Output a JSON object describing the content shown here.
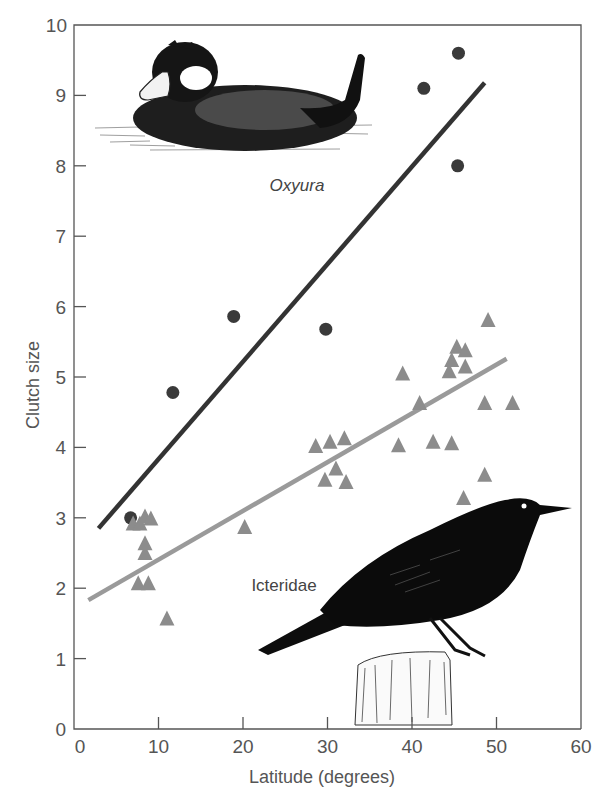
{
  "chart_data": {
    "type": "scatter",
    "title": "",
    "xlabel": "Latitude (degrees)",
    "ylabel": "Clutch size",
    "xlim": [
      0,
      60
    ],
    "ylim": [
      0,
      10
    ],
    "x_ticks": [
      0,
      10,
      20,
      30,
      40,
      50,
      60
    ],
    "y_ticks": [
      0,
      1,
      2,
      3,
      4,
      5,
      6,
      7,
      8,
      9,
      10
    ],
    "grid": false,
    "legend": "none (series labeled directly with text and illustrations)",
    "series": [
      {
        "name": "Oxyura",
        "marker": "circle",
        "color": "#3a3a3a",
        "points": [
          {
            "x": 6.7,
            "y": 3.0
          },
          {
            "x": 11.7,
            "y": 4.78
          },
          {
            "x": 18.9,
            "y": 5.86
          },
          {
            "x": 29.8,
            "y": 5.68
          },
          {
            "x": 41.4,
            "y": 9.1
          },
          {
            "x": 45.5,
            "y": 9.6
          },
          {
            "x": 45.4,
            "y": 8.0
          }
        ],
        "trendline": {
          "x": [
            2.9,
            48.6
          ],
          "y": [
            2.85,
            9.18
          ],
          "color": "#333333"
        }
      },
      {
        "name": "Icteridae",
        "marker": "triangle",
        "color": "#8c8c8c",
        "points": [
          {
            "x": 7.0,
            "y": 2.92
          },
          {
            "x": 7.8,
            "y": 2.92
          },
          {
            "x": 8.4,
            "y": 3.02
          },
          {
            "x": 9.1,
            "y": 2.99
          },
          {
            "x": 8.4,
            "y": 2.64
          },
          {
            "x": 8.4,
            "y": 2.5
          },
          {
            "x": 7.6,
            "y": 2.07
          },
          {
            "x": 8.8,
            "y": 2.07
          },
          {
            "x": 11.0,
            "y": 1.57
          },
          {
            "x": 20.2,
            "y": 2.87
          },
          {
            "x": 28.6,
            "y": 4.02
          },
          {
            "x": 30.3,
            "y": 4.08
          },
          {
            "x": 32.0,
            "y": 4.13
          },
          {
            "x": 31.0,
            "y": 3.7
          },
          {
            "x": 29.7,
            "y": 3.54
          },
          {
            "x": 32.2,
            "y": 3.51
          },
          {
            "x": 38.4,
            "y": 4.03
          },
          {
            "x": 38.9,
            "y": 5.05
          },
          {
            "x": 40.9,
            "y": 4.63
          },
          {
            "x": 42.5,
            "y": 4.08
          },
          {
            "x": 44.7,
            "y": 4.06
          },
          {
            "x": 44.4,
            "y": 5.08
          },
          {
            "x": 44.7,
            "y": 5.24
          },
          {
            "x": 45.3,
            "y": 5.43
          },
          {
            "x": 46.3,
            "y": 5.38
          },
          {
            "x": 46.3,
            "y": 5.15
          },
          {
            "x": 46.1,
            "y": 3.28
          },
          {
            "x": 48.6,
            "y": 3.61
          },
          {
            "x": 48.6,
            "y": 4.63
          },
          {
            "x": 49.0,
            "y": 5.81
          },
          {
            "x": 51.9,
            "y": 4.63
          }
        ],
        "trendline": {
          "x": [
            1.7,
            51.2
          ],
          "y": [
            1.83,
            5.26
          ],
          "color": "#9a9a9a"
        }
      }
    ],
    "annotations": [
      {
        "text": "Oxyura",
        "x": 30.5,
        "y": 7.75,
        "style": "italic",
        "illustration": "ruddy-duck drawing (upper left)"
      },
      {
        "text": "Icteridae",
        "x": 28.5,
        "y": 2.05,
        "style": "normal",
        "illustration": "grackle on post drawing (lower right)"
      }
    ]
  },
  "plot": {
    "origin_px": [
      74,
      729
    ],
    "px_per_x": 8.45,
    "px_per_y": 70.4,
    "right_px": 581,
    "top_px": 25
  },
  "illustrations": {
    "duck": {
      "name": "Oxyura (ruddy duck)"
    },
    "grackle": {
      "name": "Icteridae (grackle)"
    }
  }
}
